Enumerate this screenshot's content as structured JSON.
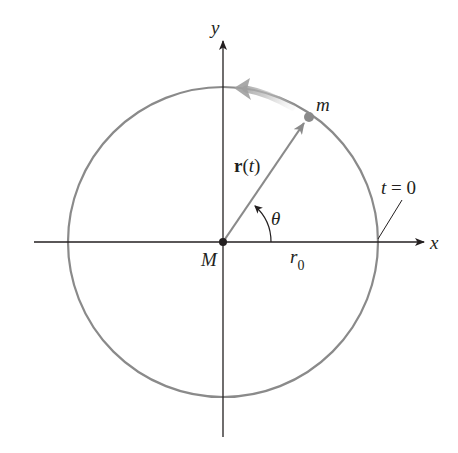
{
  "figure": {
    "type": "circular-orbit-diagram",
    "colors": {
      "axes": "#231f20",
      "circle": "#8a8a8a",
      "position_vector": "#8a8a8a",
      "velocity_arrow": "#a8a8a8",
      "mass_point": "#8a8a8a",
      "central_mass": "#231f20",
      "text": "#231f20"
    },
    "labels": {
      "x_axis": "x",
      "y_axis": "y",
      "central_mass": "M",
      "orbiting_mass": "m",
      "position_vector_bold": "r",
      "position_vector_open": "(",
      "position_vector_arg": "t",
      "position_vector_close": ")",
      "angle": "θ",
      "radius_base": "r",
      "radius_sub": "0",
      "start_time": "t = 0"
    },
    "geometry": {
      "center": [
        223,
        242
      ],
      "radius": 155,
      "mass_position": [
        309,
        116
      ]
    }
  }
}
